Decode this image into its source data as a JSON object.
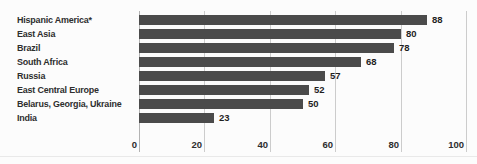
{
  "chart_data": {
    "type": "bar",
    "orientation": "horizontal",
    "title": "",
    "xlabel": "",
    "ylabel": "",
    "categories": [
      "Hispanic America*",
      "East Asia",
      "Brazil",
      "South Africa",
      "Russia",
      "East Central Europe",
      "Belarus, Georgia, Ukraine",
      "India"
    ],
    "values": [
      88,
      80,
      78,
      68,
      57,
      52,
      50,
      23
    ],
    "value_labels": [
      "88",
      "80",
      "78",
      "68",
      "57",
      "52",
      "50",
      "23"
    ],
    "xlim": [
      0,
      100
    ],
    "xticks": [
      0,
      20,
      40,
      60,
      80,
      100
    ],
    "xtick_labels": [
      "0",
      "20",
      "40",
      "60",
      "80",
      "100"
    ],
    "grid": true,
    "legend": false,
    "colors": {
      "bar": "#4b4b4b",
      "gridline": "#cccccc",
      "zero_axis": "#b3b3b3",
      "text": "#2e2e2e",
      "background": "#fcfcfc"
    }
  }
}
